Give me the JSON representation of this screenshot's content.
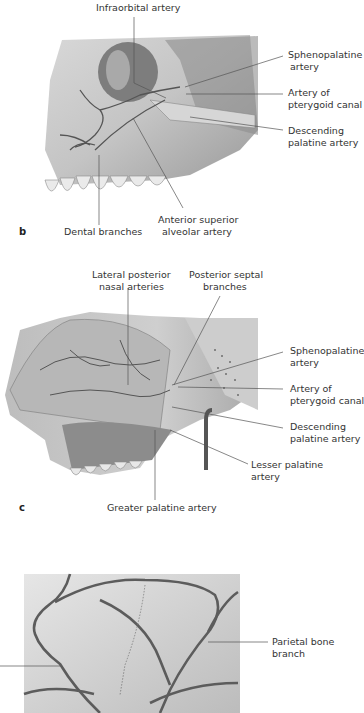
{
  "figure_b": {
    "panel_letter": "b",
    "labels": {
      "infraorbital": "Infraorbital artery",
      "sphenopalatine_1": "Sphenopalatine",
      "sphenopalatine_2": "artery",
      "pterygoid_1": "Artery of",
      "pterygoid_2": "pterygoid canal",
      "descending_1": "Descending",
      "descending_2": "palatine artery",
      "dental": "Dental branches",
      "anterior_1": "Anterior superior",
      "anterior_2": "alveolar artery"
    }
  },
  "figure_c": {
    "panel_letter": "c",
    "labels": {
      "lateral_1": "Lateral posterior",
      "lateral_2": "nasal arteries",
      "septal_1": "Posterior septal",
      "septal_2": "branches",
      "sphenopalatine_1": "Sphenopalatine",
      "sphenopalatine_2": "artery",
      "pterygoid_1": "Artery of",
      "pterygoid_2": "pterygoid canal",
      "descending_1": "Descending",
      "descending_2": "palatine artery",
      "lesser_1": "Lesser palatine",
      "lesser_2": "artery",
      "greater": "Greater palatine artery"
    }
  },
  "figure_d": {
    "labels": {
      "parietal_1": "Parietal bone",
      "parietal_2": "branch"
    }
  }
}
